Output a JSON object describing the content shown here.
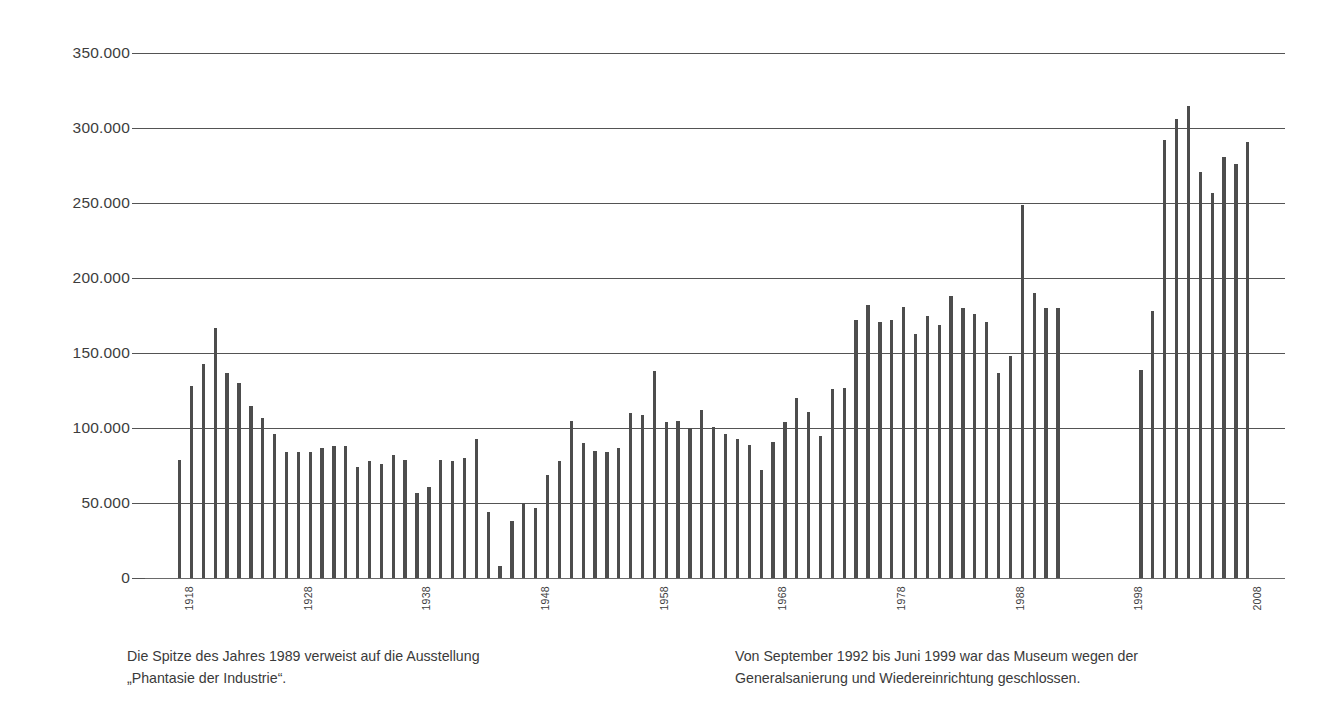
{
  "chart_data": {
    "type": "bar",
    "title": "",
    "subtitle": "",
    "xlabel": "",
    "ylabel": "",
    "ylim": [
      0,
      350000
    ],
    "grid": true,
    "legend": null,
    "y_ticks": [
      0,
      50000,
      100000,
      150000,
      200000,
      250000,
      300000,
      350000
    ],
    "y_tick_labels": [
      "0",
      "50.000",
      "100.000",
      "150.000",
      "200.000",
      "250.000",
      "300.000",
      "350.000"
    ],
    "x_tick_labels": [
      "1918",
      "1928",
      "1938",
      "1948",
      "1958",
      "1968",
      "1978",
      "1988",
      "1998",
      "2008"
    ],
    "x_tick_years": [
      1918,
      1928,
      1938,
      1948,
      1958,
      1968,
      1978,
      1988,
      1998,
      2008
    ],
    "x_range": [
      1918,
      2008
    ],
    "gap_years": [
      1993,
      1994,
      1995,
      1996,
      1997,
      1998
    ],
    "series_name": "Besucherzahlen",
    "bar_color": "#4d4d4d",
    "grid_color": "#545454",
    "categories": [
      1918,
      1919,
      1920,
      1921,
      1922,
      1923,
      1924,
      1925,
      1926,
      1927,
      1928,
      1929,
      1930,
      1931,
      1932,
      1933,
      1934,
      1935,
      1936,
      1937,
      1938,
      1939,
      1940,
      1941,
      1942,
      1943,
      1944,
      1945,
      1946,
      1947,
      1948,
      1949,
      1950,
      1951,
      1952,
      1953,
      1954,
      1955,
      1956,
      1957,
      1958,
      1959,
      1960,
      1961,
      1962,
      1963,
      1964,
      1965,
      1966,
      1967,
      1968,
      1969,
      1970,
      1971,
      1972,
      1973,
      1974,
      1975,
      1976,
      1977,
      1978,
      1979,
      1980,
      1981,
      1982,
      1983,
      1984,
      1985,
      1986,
      1987,
      1988,
      1989,
      1990,
      1991,
      1992,
      1999,
      2000,
      2001,
      2002,
      2003,
      2004,
      2005,
      2006,
      2007,
      2008
    ],
    "values": [
      79000,
      128000,
      143000,
      167000,
      137000,
      130000,
      115000,
      107000,
      96000,
      84000,
      84000,
      84000,
      87000,
      88000,
      88000,
      74000,
      78000,
      76000,
      82000,
      79000,
      57000,
      61000,
      79000,
      78000,
      80000,
      93000,
      44000,
      8000,
      38000,
      50000,
      47000,
      69000,
      78000,
      105000,
      90000,
      85000,
      84000,
      87000,
      110000,
      109000,
      138000,
      104000,
      105000,
      100000,
      112000,
      101000,
      96000,
      93000,
      89000,
      72000,
      91000,
      104000,
      120000,
      111000,
      95000,
      126000,
      127000,
      172000,
      182000,
      171000,
      172000,
      181000,
      163000,
      175000,
      169000,
      188000,
      180000,
      176000,
      171000,
      137000,
      148000,
      249000,
      190000,
      180000,
      180000,
      139000,
      178000,
      292000,
      306000,
      315000,
      271000,
      257000,
      281000,
      276000,
      291000
    ],
    "annotations": [
      {
        "id": "caption-left",
        "text": "Die Spitze des Jahres 1989 verweist auf die Ausstellung\n„Phantasie der Industrie“."
      },
      {
        "id": "caption-right",
        "text": "Von September 1992 bis Juni 1999 war das Museum wegen der\nGeneralsanierung und Wiedereinrichtung geschlossen."
      }
    ]
  },
  "captions": {
    "left": "Die Spitze des Jahres 1989 verweist auf die Ausstellung\n„Phantasie der Industrie“.",
    "right": "Von September 1992 bis Juni 1999 war das Museum wegen der\nGeneralsanierung und Wiedereinrichtung geschlossen."
  }
}
